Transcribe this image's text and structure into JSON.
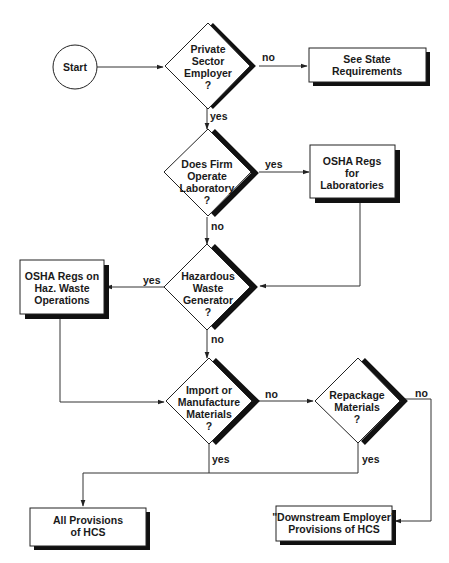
{
  "diagram": {
    "type": "flowchart",
    "colors": {
      "line": "#333333",
      "shadow": "#111111",
      "fill": "#ffffff",
      "text": "#1a1a1a"
    },
    "nodes": [
      {
        "id": "start",
        "shape": "circle",
        "label_lines": [
          "Start"
        ]
      },
      {
        "id": "private_sector",
        "shape": "diamond",
        "label_lines": [
          "Private",
          "Sector",
          "Employer",
          "?"
        ]
      },
      {
        "id": "see_state",
        "shape": "box",
        "label_lines": [
          "See State",
          "Requirements"
        ]
      },
      {
        "id": "operate_lab",
        "shape": "diamond",
        "label_lines": [
          "Does Firm",
          "Operate",
          "Laboratory",
          "?"
        ]
      },
      {
        "id": "osha_lab",
        "shape": "box",
        "label_lines": [
          "OSHA Regs",
          "for",
          "Laboratories"
        ]
      },
      {
        "id": "haz_waste",
        "shape": "diamond",
        "label_lines": [
          "Hazardous",
          "Waste",
          "Generator",
          "?"
        ]
      },
      {
        "id": "osha_haz",
        "shape": "box",
        "label_lines": [
          "OSHA Regs on",
          "Haz. Waste",
          "Operations"
        ]
      },
      {
        "id": "import_mfg",
        "shape": "diamond",
        "label_lines": [
          "Import or",
          "Manufacture",
          "Materials",
          "?"
        ]
      },
      {
        "id": "repackage",
        "shape": "diamond",
        "label_lines": [
          "Repackage",
          "Materials",
          "?"
        ]
      },
      {
        "id": "all_hcs",
        "shape": "box",
        "label_lines": [
          "All Provisions",
          "of HCS"
        ]
      },
      {
        "id": "downstream",
        "shape": "box",
        "label_lines": [
          "\"Downstream Employer\"",
          "Provisions of HCS"
        ]
      }
    ],
    "edges": [
      {
        "from": "start",
        "to": "private_sector",
        "label": ""
      },
      {
        "from": "private_sector",
        "to": "see_state",
        "label": "no"
      },
      {
        "from": "private_sector",
        "to": "operate_lab",
        "label": "yes"
      },
      {
        "from": "operate_lab",
        "to": "osha_lab",
        "label": "yes"
      },
      {
        "from": "operate_lab",
        "to": "haz_waste",
        "label": "no"
      },
      {
        "from": "osha_lab",
        "to": "haz_waste",
        "label": ""
      },
      {
        "from": "haz_waste",
        "to": "osha_haz",
        "label": "yes"
      },
      {
        "from": "haz_waste",
        "to": "import_mfg",
        "label": "no"
      },
      {
        "from": "osha_haz",
        "to": "import_mfg",
        "label": ""
      },
      {
        "from": "import_mfg",
        "to": "repackage",
        "label": "no"
      },
      {
        "from": "import_mfg",
        "to": "all_hcs",
        "label": "yes"
      },
      {
        "from": "repackage",
        "to": "all_hcs",
        "label": "yes"
      },
      {
        "from": "repackage",
        "to": "downstream",
        "label": "no"
      }
    ],
    "edge_labels": {
      "private_no": "no",
      "private_yes": "yes",
      "lab_yes": "yes",
      "lab_no": "no",
      "haz_yes": "yes",
      "haz_no": "no",
      "import_no": "no",
      "import_yes": "yes",
      "repack_no": "no",
      "repack_yes": "yes"
    }
  }
}
